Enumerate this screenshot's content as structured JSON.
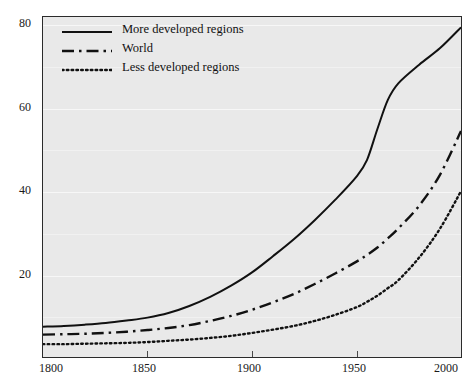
{
  "figure": {
    "clipped_top_text": "",
    "background_color": "#e9e9e9",
    "frame_color": "#2b2b2b",
    "gridline_color": "#f7f7f7",
    "line_color": "#111111"
  },
  "legend": {
    "position": "top-left",
    "entries": [
      {
        "label": "More developed regions",
        "style": "solid",
        "swatch_name": "solid-line-swatch"
      },
      {
        "label": "World",
        "style": "dash-dot",
        "swatch_name": "dash-dot-line-swatch"
      },
      {
        "label": "Less developed regions",
        "style": "dotted",
        "swatch_name": "dotted-line-swatch"
      }
    ]
  },
  "axes": {
    "x_ticks": [
      "1800",
      "1850",
      "1900",
      "1950",
      "2000"
    ],
    "y_ticks": [
      "20",
      "40",
      "60",
      "80"
    ],
    "xlabel": "",
    "ylabel": ""
  },
  "chart_data": {
    "type": "line",
    "title": "",
    "subtitle": "",
    "xlabel": "",
    "ylabel": "",
    "xlim": [
      1800,
      2000
    ],
    "ylim": [
      0,
      82
    ],
    "x_ticks": [
      1800,
      1850,
      1900,
      1950,
      2000
    ],
    "y_ticks": [
      20,
      40,
      60,
      80
    ],
    "grid": true,
    "legend_position": "top-left",
    "x": [
      1800,
      1810,
      1820,
      1830,
      1840,
      1850,
      1860,
      1870,
      1880,
      1890,
      1900,
      1910,
      1920,
      1930,
      1940,
      1950,
      1955,
      1960,
      1965,
      1970,
      1980,
      1990,
      2000
    ],
    "series": [
      {
        "name": "More developed regions",
        "style": "solid",
        "values": [
          7.3,
          7.5,
          7.8,
          8.2,
          8.8,
          9.5,
          10.6,
          12.3,
          14.5,
          17.2,
          20.4,
          24.3,
          28.4,
          33.0,
          38.0,
          43.5,
          47.5,
          55.0,
          62.0,
          66.0,
          70.5,
          74.5,
          79.5
        ]
      },
      {
        "name": "World",
        "style": "dash-dot",
        "values": [
          5.4,
          5.5,
          5.6,
          5.8,
          6.1,
          6.5,
          7.0,
          7.7,
          8.7,
          9.9,
          11.4,
          13.2,
          15.2,
          17.6,
          20.2,
          23.0,
          24.6,
          26.4,
          28.6,
          31.0,
          36.5,
          44.0,
          54.5
        ]
      },
      {
        "name": "Less developed regions",
        "style": "dotted",
        "values": [
          3.1,
          3.1,
          3.2,
          3.3,
          3.4,
          3.6,
          3.9,
          4.2,
          4.6,
          5.1,
          5.8,
          6.6,
          7.5,
          8.7,
          10.2,
          12.0,
          13.3,
          14.8,
          16.6,
          18.5,
          24.0,
          31.0,
          40.0
        ]
      }
    ]
  }
}
